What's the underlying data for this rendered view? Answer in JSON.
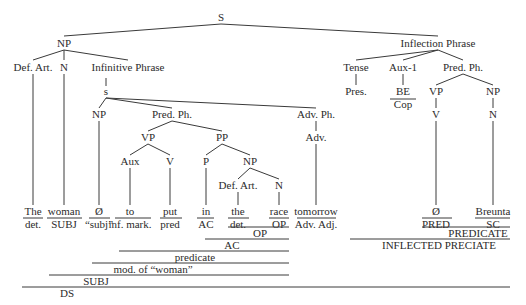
{
  "colors": {
    "ink": "#2b2b2b",
    "line": "#3a3a3a",
    "background": "#ffffff"
  },
  "nodes": [
    {
      "id": "S",
      "label": "S",
      "x": 221,
      "y": 21
    },
    {
      "id": "NP1",
      "label": "NP",
      "x": 64,
      "y": 47
    },
    {
      "id": "DefArt1",
      "label": "Def. Art.",
      "x": 33,
      "y": 71
    },
    {
      "id": "N1",
      "label": "N",
      "x": 64,
      "y": 71
    },
    {
      "id": "InfPh",
      "label": "Infinitive Phrase",
      "x": 128,
      "y": 71
    },
    {
      "id": "s",
      "label": "s",
      "x": 106,
      "y": 95
    },
    {
      "id": "NP2",
      "label": "NP",
      "x": 99,
      "y": 118
    },
    {
      "id": "PredPh1",
      "label": "Pred. Ph.",
      "x": 172,
      "y": 118
    },
    {
      "id": "VP1",
      "label": "VP",
      "x": 148,
      "y": 141
    },
    {
      "id": "Aux",
      "label": "Aux",
      "x": 130,
      "y": 165
    },
    {
      "id": "V1",
      "label": "V",
      "x": 170,
      "y": 165
    },
    {
      "id": "PP",
      "label": "PP",
      "x": 222,
      "y": 141
    },
    {
      "id": "P",
      "label": "P",
      "x": 206,
      "y": 165
    },
    {
      "id": "NP3",
      "label": "NP",
      "x": 250,
      "y": 165
    },
    {
      "id": "DefArt2",
      "label": "Def. Art.",
      "x": 238,
      "y": 189
    },
    {
      "id": "N3",
      "label": "N",
      "x": 279,
      "y": 189
    },
    {
      "id": "AdvPh",
      "label": "Adv. Ph.",
      "x": 316,
      "y": 118
    },
    {
      "id": "Adv",
      "label": "Adv.",
      "x": 316,
      "y": 141
    },
    {
      "id": "InflPh",
      "label": "Inflection Phrase",
      "x": 438,
      "y": 47
    },
    {
      "id": "Tense",
      "label": "Tense",
      "x": 356,
      "y": 71
    },
    {
      "id": "Pres",
      "label": "Pres.",
      "x": 356,
      "y": 95
    },
    {
      "id": "Aux1",
      "label": "Aux-1",
      "x": 403,
      "y": 71
    },
    {
      "id": "BE",
      "label": "BE",
      "x": 403,
      "y": 95
    },
    {
      "id": "PredPh2",
      "label": "Pred. Ph.",
      "x": 463,
      "y": 71
    },
    {
      "id": "VP2",
      "label": "VP",
      "x": 436,
      "y": 95
    },
    {
      "id": "V2",
      "label": "V",
      "x": 436,
      "y": 118
    },
    {
      "id": "NP4",
      "label": "NP",
      "x": 493,
      "y": 95
    },
    {
      "id": "N4",
      "label": "N",
      "x": 493,
      "y": 118
    }
  ],
  "edges": [
    [
      221,
      24,
      64,
      36
    ],
    [
      221,
      24,
      438,
      36
    ],
    [
      64,
      50,
      33,
      60
    ],
    [
      64,
      50,
      64,
      60
    ],
    [
      64,
      50,
      128,
      60
    ],
    [
      106,
      78,
      106,
      86
    ],
    [
      106,
      98,
      99,
      108
    ],
    [
      106,
      98,
      172,
      108
    ],
    [
      106,
      98,
      316,
      108
    ],
    [
      172,
      121,
      148,
      131
    ],
    [
      172,
      121,
      222,
      131
    ],
    [
      148,
      144,
      130,
      155
    ],
    [
      148,
      144,
      170,
      155
    ],
    [
      222,
      144,
      206,
      155
    ],
    [
      222,
      144,
      250,
      155
    ],
    [
      250,
      168,
      238,
      179
    ],
    [
      250,
      168,
      279,
      179
    ],
    [
      316,
      121,
      316,
      131
    ],
    [
      438,
      50,
      356,
      60
    ],
    [
      438,
      50,
      403,
      60
    ],
    [
      438,
      50,
      463,
      60
    ],
    [
      356,
      74,
      356,
      85
    ],
    [
      403,
      74,
      403,
      85
    ],
    [
      463,
      74,
      436,
      85
    ],
    [
      463,
      74,
      493,
      85
    ],
    [
      436,
      98,
      436,
      108
    ],
    [
      493,
      98,
      493,
      108
    ],
    [
      33,
      74,
      33,
      205
    ],
    [
      64,
      74,
      64,
      205
    ],
    [
      99,
      121,
      99,
      205
    ],
    [
      130,
      168,
      130,
      205
    ],
    [
      170,
      168,
      170,
      205
    ],
    [
      206,
      168,
      206,
      205
    ],
    [
      238,
      192,
      238,
      205
    ],
    [
      279,
      192,
      279,
      205
    ],
    [
      316,
      144,
      316,
      205
    ],
    [
      436,
      121,
      436,
      205
    ],
    [
      493,
      121,
      493,
      205
    ]
  ],
  "words": [
    {
      "word": "The",
      "role": "det.",
      "x": 33,
      "x1": 23,
      "x2": 43
    },
    {
      "word": "woman",
      "role": "SUBJ",
      "x": 64,
      "x1": 47,
      "x2": 82
    },
    {
      "word": "Ø",
      "role": "“subj”",
      "x": 99,
      "x1": 89,
      "x2": 110
    },
    {
      "word": "to",
      "role": "inf. mark.",
      "x": 130,
      "x1": 115,
      "x2": 151
    },
    {
      "word": "put",
      "role": "pred",
      "x": 170,
      "x1": 160,
      "x2": 182
    },
    {
      "word": "in",
      "role": "AC",
      "x": 206,
      "x1": 197,
      "x2": 214
    },
    {
      "word": "the",
      "role": "det.",
      "x": 238,
      "x1": 228,
      "x2": 249
    },
    {
      "word": "race",
      "role": "OP",
      "x": 279,
      "x1": 269,
      "x2": 289
    },
    {
      "word": "tomorrow",
      "role": "Adv. Adj.",
      "x": 316,
      "x1": 297,
      "x2": 336
    },
    {
      "word": "Ø",
      "role": "PRED",
      "x": 436,
      "x1": 422,
      "x2": 452
    },
    {
      "word": "Breunta",
      "role": "SC",
      "x": 493,
      "x1": 475,
      "x2": 510
    }
  ],
  "brackets": [
    {
      "label": "OP",
      "x1": 228,
      "x2": 289,
      "y": 227,
      "label_x": 260
    },
    {
      "label": "AC",
      "x1": 205,
      "x2": 289,
      "y": 239,
      "label_x": 232
    },
    {
      "label": "predicate",
      "x1": 119,
      "x2": 289,
      "y": 251,
      "label_x": 195
    },
    {
      "label": "mod. of “woman”",
      "x1": 92,
      "x2": 289,
      "y": 263,
      "label_x": 153
    },
    {
      "label": "SUBJ",
      "x1": 49,
      "x2": 289,
      "y": 275,
      "label_x": 96
    },
    {
      "label": "DS",
      "x1": 22,
      "x2": 510,
      "y": 287,
      "label_x": 67
    },
    {
      "label": "PREDICATE",
      "x1": 422,
      "x2": 510,
      "y": 227,
      "label_x": 478
    },
    {
      "label": "INFLECTED PRECIATE",
      "x1": 350,
      "x2": 510,
      "y": 239,
      "label_x": 439
    }
  ],
  "cop_label": {
    "text": "Cop",
    "x": 403,
    "y": 108,
    "x1": 390,
    "x2": 416,
    "line_y": 99
  }
}
